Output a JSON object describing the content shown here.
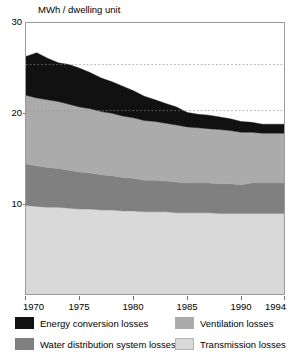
{
  "axis": {
    "unit_label": "MWh / dwelling unit",
    "y_ticks": [
      "30",
      "20",
      "10"
    ],
    "x_ticks": [
      "1970",
      "1975",
      "1980",
      "1985",
      "1990",
      "1994"
    ]
  },
  "legend": {
    "items": [
      {
        "label": "Energy conversion losses",
        "color": "#111111"
      },
      {
        "label": "Water distribution system losses",
        "color": "#808080"
      },
      {
        "label": "Ventilation losses",
        "color": "#ababab"
      },
      {
        "label": "Transmission losses",
        "color": "#d9d9d9"
      }
    ]
  },
  "chart_data": {
    "type": "area",
    "stacked": true,
    "title": "",
    "subtitle": "",
    "xlabel": "",
    "ylabel": "MWh / dwelling unit",
    "xlim": [
      1970,
      1994
    ],
    "ylim": [
      0,
      30
    ],
    "grid": "horizontal-dashed",
    "gridlines": [
      25.4,
      20.3
    ],
    "legend_position": "below-plot",
    "x": [
      1970,
      1971,
      1972,
      1973,
      1974,
      1975,
      1976,
      1977,
      1978,
      1979,
      1980,
      1981,
      1982,
      1983,
      1984,
      1985,
      1986,
      1987,
      1988,
      1989,
      1990,
      1991,
      1992,
      1993,
      1994
    ],
    "series": [
      {
        "name": "Transmission losses",
        "color": "#d9d9d9",
        "values": [
          9.8,
          9.7,
          9.6,
          9.6,
          9.5,
          9.4,
          9.4,
          9.3,
          9.3,
          9.2,
          9.2,
          9.1,
          9.1,
          9.1,
          9.0,
          9.0,
          9.0,
          9.0,
          8.9,
          8.9,
          8.9,
          8.9,
          8.9,
          8.9,
          8.9
        ]
      },
      {
        "name": "Water distribution system losses",
        "color": "#808080",
        "values": [
          4.6,
          4.5,
          4.4,
          4.3,
          4.2,
          4.1,
          4.0,
          3.9,
          3.8,
          3.7,
          3.6,
          3.5,
          3.5,
          3.4,
          3.4,
          3.3,
          3.3,
          3.3,
          3.3,
          3.3,
          3.2,
          3.4,
          3.4,
          3.4,
          3.4
        ]
      },
      {
        "name": "Ventilation losses",
        "color": "#ababab",
        "values": [
          7.6,
          7.5,
          7.5,
          7.4,
          7.3,
          7.2,
          7.1,
          7.0,
          6.9,
          6.8,
          6.7,
          6.6,
          6.5,
          6.4,
          6.3,
          6.2,
          6.1,
          6.0,
          6.0,
          5.9,
          5.8,
          5.6,
          5.5,
          5.5,
          5.5
        ]
      },
      {
        "name": "Energy conversion losses",
        "color": "#111111",
        "values": [
          4.3,
          5.0,
          4.6,
          4.3,
          4.4,
          4.3,
          4.0,
          3.7,
          3.5,
          3.3,
          3.0,
          2.7,
          2.4,
          2.2,
          2.0,
          1.6,
          1.5,
          1.5,
          1.4,
          1.3,
          1.2,
          1.1,
          1.0,
          1.0,
          1.0
        ]
      }
    ],
    "totals": [
      26.3,
      26.7,
      26.1,
      25.6,
      25.4,
      25.0,
      24.5,
      23.9,
      23.5,
      23.0,
      22.5,
      21.9,
      21.5,
      21.1,
      20.7,
      20.1,
      19.9,
      19.8,
      19.6,
      19.4,
      19.1,
      19.0,
      18.8,
      18.8,
      18.8
    ]
  }
}
